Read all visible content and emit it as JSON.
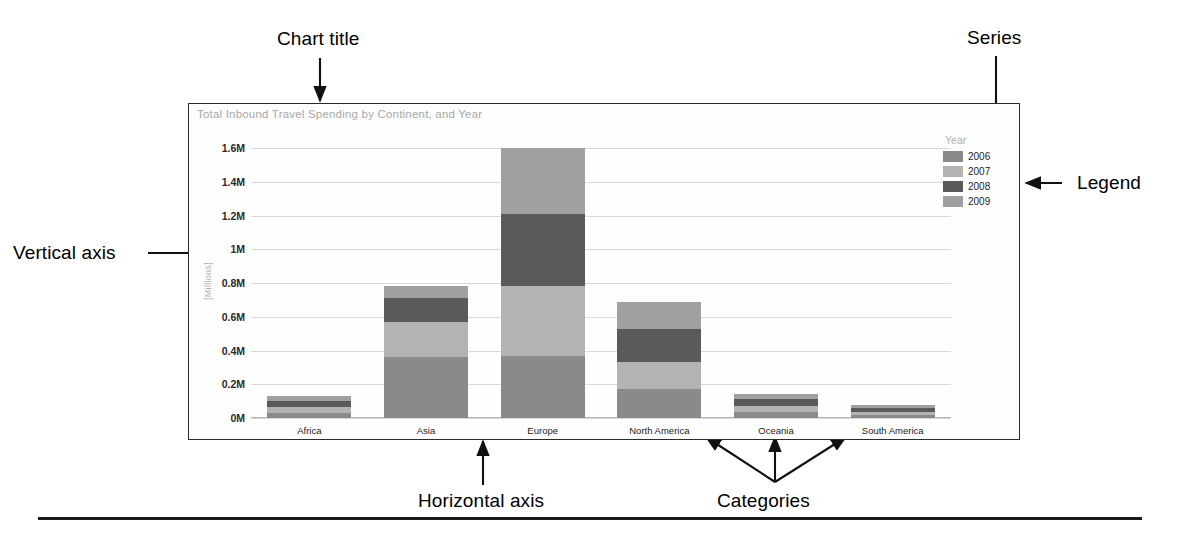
{
  "annotations": [
    {
      "id": "chart-title-callout",
      "label": "Chart title"
    },
    {
      "id": "series-callout",
      "label": "Series"
    },
    {
      "id": "legend-callout",
      "label": "Legend"
    },
    {
      "id": "vertical-axis-callout",
      "label": "Vertical axis"
    },
    {
      "id": "horizontal-axis-callout",
      "label": "Horizontal axis"
    },
    {
      "id": "categories-callout",
      "label": "Categories"
    }
  ],
  "chart": {
    "title": "Total Inbound Travel Spending by Continent, and Year",
    "y_axis_title": "[Millions]",
    "legend_title": "Year"
  },
  "chart_data": {
    "type": "bar",
    "title": "Total Inbound Travel Spending by Continent, and Year",
    "subtitle": "",
    "xlabel": "",
    "ylabel": "[Millions]",
    "stacked": true,
    "grid": true,
    "legend_position": "right",
    "legend_title": "Year",
    "ylim": [
      0,
      1600000
    ],
    "ytick_labels": [
      "1.6M",
      "1.4M",
      "1.2M",
      "1M",
      "0.8M",
      "0.6M",
      "0.4M",
      "0.2M",
      "0M"
    ],
    "ytick_values": [
      1600000,
      1400000,
      1200000,
      1000000,
      800000,
      600000,
      400000,
      200000,
      0
    ],
    "categories": [
      "Africa",
      "Asia",
      "Europe",
      "North America",
      "Oceania",
      "South America"
    ],
    "series": [
      {
        "name": "2006",
        "color": "#8a8a8a",
        "values": [
          30000,
          360000,
          370000,
          170000,
          35000,
          18000
        ]
      },
      {
        "name": "2007",
        "color": "#b3b3b3",
        "values": [
          33000,
          210000,
          410000,
          160000,
          38000,
          20000
        ]
      },
      {
        "name": "2008",
        "color": "#5a5a5a",
        "values": [
          35000,
          140000,
          430000,
          200000,
          38000,
          22000
        ]
      },
      {
        "name": "2009",
        "color": "#a0a0a0",
        "values": [
          32000,
          70000,
          390000,
          160000,
          33000,
          20000
        ]
      }
    ],
    "totals": [
      130000,
      780000,
      1600000,
      690000,
      144000,
      80000
    ]
  }
}
